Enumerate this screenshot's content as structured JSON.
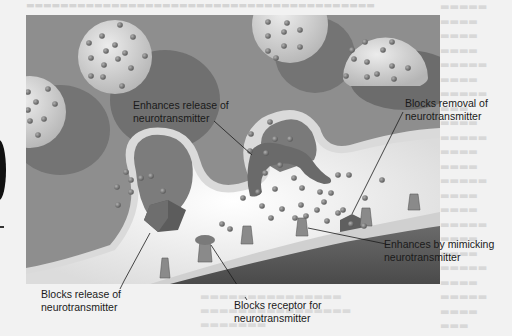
{
  "figure": {
    "labels": {
      "enhances_release": {
        "line1": "Enhances release of",
        "line2": "neurotransmitter"
      },
      "blocks_removal": {
        "line1": "Blocks removal of",
        "line2": "neurotransmitter"
      },
      "blocks_release": {
        "line1": "Blocks release of",
        "line2": "neurotransmitter"
      },
      "blocks_receptor": {
        "line1": "Blocks receptor for",
        "line2": "neurotransmitter"
      },
      "enhances_mimicking": {
        "line1": "Enhances by mimicking",
        "line2": "neurotransmitter"
      }
    },
    "colors": {
      "background": "#8c8c8c",
      "vesicle_light": "#d6d6d6",
      "vesicle_shadow": "#6e6e6e",
      "membrane": "#d9d9d9",
      "cleft": "#f4f4f4",
      "postsynaptic": "#5a5a5a",
      "molecule": "#7a7a7a",
      "drug": "#6a6a6a"
    }
  }
}
